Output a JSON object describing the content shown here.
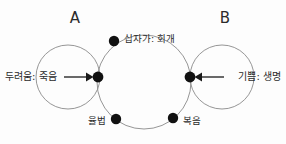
{
  "diagram": {
    "type": "venn-cycle-diagram",
    "background_color": "#fdfdfd",
    "outline_color": "#8a8a8a",
    "dot_color": "#111111",
    "text_color": "#2b2b2b",
    "groups": {
      "left_label": "A",
      "right_label": "B"
    },
    "circles": [
      {
        "name": "left-circle",
        "cx": 68,
        "cy": 77,
        "r": 32
      },
      {
        "name": "center-circle",
        "cx": 144,
        "cy": 82,
        "r": 47
      },
      {
        "name": "right-circle",
        "cx": 222,
        "cy": 77,
        "r": 32
      }
    ],
    "nodes": [
      {
        "name": "top-node",
        "label": "십자가: 회개",
        "cx": 114,
        "cy": 41,
        "r": 5.2,
        "label_x": 124,
        "label_y": 39,
        "align": "start"
      },
      {
        "name": "left-intersection-node",
        "label": "",
        "cx": 98,
        "cy": 77,
        "r": 5.4,
        "label_x": 0,
        "label_y": 0,
        "align": "start"
      },
      {
        "name": "right-intersection-node",
        "label": "",
        "cx": 190,
        "cy": 77,
        "r": 5.4,
        "label_x": 0,
        "label_y": 0,
        "align": "start"
      },
      {
        "name": "bottom-left-node",
        "label": "율법",
        "cx": 116,
        "cy": 119,
        "r": 5.2,
        "label_x": 106,
        "label_y": 121,
        "align": "end"
      },
      {
        "name": "bottom-right-node",
        "label": "복음",
        "cx": 173,
        "cy": 118,
        "r": 5.2,
        "label_x": 183,
        "label_y": 121,
        "align": "start"
      }
    ],
    "flows": [
      {
        "name": "left-inflow",
        "label": "두려움: 죽음",
        "label_x": 5,
        "label_y": 77,
        "align": "start",
        "direction": "right",
        "line_x1": 64,
        "line_x2": 90,
        "line_y": 77
      },
      {
        "name": "right-inflow",
        "label": "기쁨: 생명",
        "label_x": 281,
        "label_y": 77,
        "align": "end",
        "direction": "left",
        "line_x1": 224,
        "line_x2": 198,
        "line_y": 77
      }
    ],
    "group_label_positions": {
      "left": {
        "x": 75,
        "y": 18
      },
      "right": {
        "x": 225,
        "y": 18
      }
    }
  }
}
